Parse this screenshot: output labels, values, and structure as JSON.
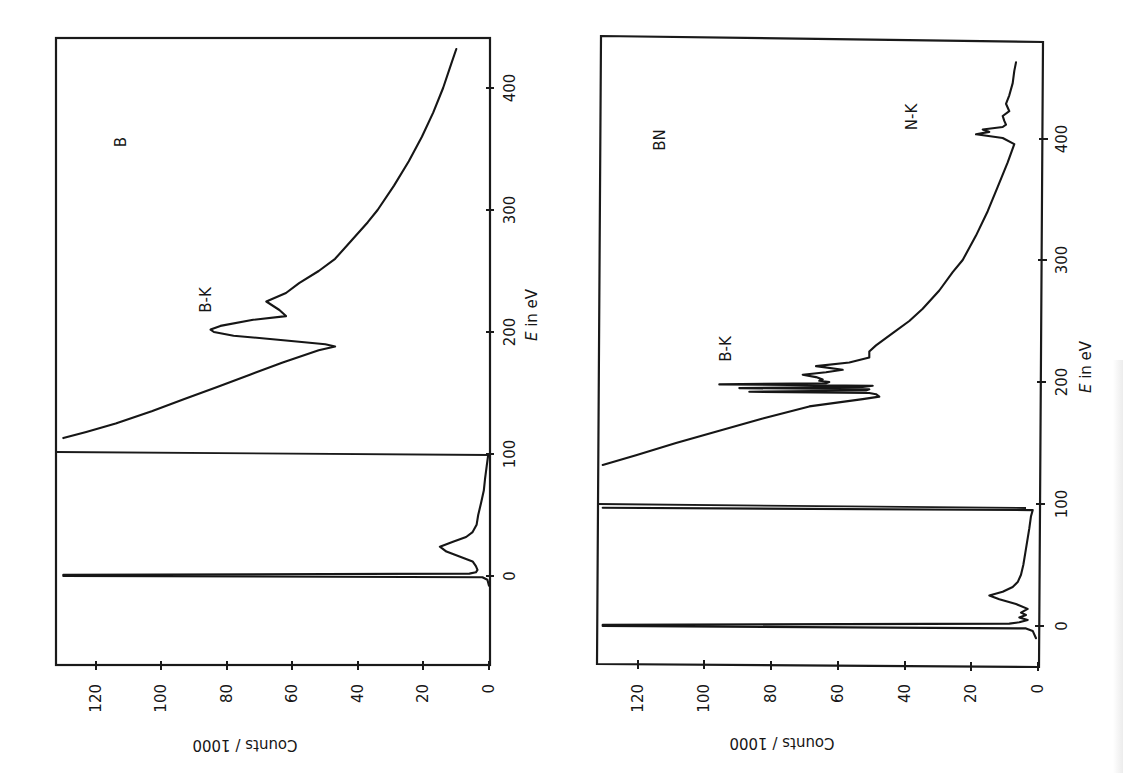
{
  "figure": {
    "panels_orientation": "rotated 90° (energy axis vertical on right, counts axis horizontal at bottom, increasing leftward)"
  },
  "chart_data": [
    {
      "type": "line",
      "title": "",
      "panel_label": "B",
      "xlabel": "E in eV",
      "ylabel": "Counts / 1000",
      "xlim": [
        -40,
        440
      ],
      "ylim": [
        0,
        130
      ],
      "grid": false,
      "x_ticks": [
        0,
        100,
        200,
        300,
        400
      ],
      "y_ticks": [
        0,
        20,
        40,
        60,
        80,
        100,
        120
      ],
      "x_tick_labels": [
        "0",
        "100",
        "200",
        "300",
        "400"
      ],
      "y_tick_labels": [
        "0",
        "20",
        "40",
        "60",
        "80",
        "100",
        "120"
      ],
      "annotations": [
        {
          "text": "B",
          "x": 355,
          "y": 110
        },
        {
          "text": "B-K",
          "x": 210,
          "y": 88
        }
      ],
      "scale_change_marker_eV": 100,
      "series": [
        {
          "name": "low-loss (zero-loss + plasmon)",
          "x": [
            -8,
            -3,
            -1,
            0,
            1,
            2,
            3,
            5,
            8,
            12,
            16,
            20,
            24,
            28,
            32,
            36,
            42,
            50,
            60,
            70,
            80,
            90,
            98,
            100
          ],
          "y": [
            0,
            0.5,
            2,
            130,
            130,
            6,
            4,
            3.5,
            4,
            5,
            9,
            13,
            15,
            11,
            7,
            5,
            3.8,
            3.3,
            2.4,
            1.6,
            1.2,
            0.7,
            0.3,
            0.2
          ]
        },
        {
          "name": "core-loss (scaled)",
          "x": [
            113,
            118,
            125,
            135,
            145,
            155,
            165,
            175,
            185,
            188,
            190,
            193,
            197,
            200,
            202,
            205,
            210,
            213,
            218,
            225,
            232,
            240,
            250,
            260,
            275,
            290,
            300,
            320,
            340,
            360,
            380,
            400,
            420,
            432
          ],
          "y": [
            130,
            123,
            114,
            103,
            93,
            83,
            73,
            63,
            52,
            47,
            50,
            62,
            78,
            84,
            85,
            82,
            72,
            62,
            64,
            68,
            62,
            58,
            52,
            47,
            42,
            37,
            34,
            29,
            24.5,
            20.5,
            17,
            14,
            11.5,
            10
          ]
        }
      ]
    },
    {
      "type": "line",
      "title": "",
      "panel_label": "BN",
      "xlabel": "E in eV",
      "ylabel": "Counts / 1000",
      "xlim": [
        -30,
        470
      ],
      "ylim": [
        0,
        130
      ],
      "grid": false,
      "x_ticks": [
        0,
        100,
        200,
        300,
        400
      ],
      "y_ticks": [
        0,
        20,
        40,
        60,
        80,
        100,
        120
      ],
      "x_tick_labels": [
        "0",
        "100",
        "200",
        "300",
        "400"
      ],
      "y_tick_labels": [
        "0",
        "20",
        "40",
        "60",
        "80",
        "100",
        "120"
      ],
      "annotations": [
        {
          "text": "BN",
          "x": 390,
          "y": 100
        },
        {
          "text": "B-K",
          "x": 230,
          "y": 89
        },
        {
          "text": "N-K",
          "x": 420,
          "y": 25
        }
      ],
      "scale_change_marker_eV": 97,
      "series": [
        {
          "name": "low-loss (zero-loss + plasmon)",
          "x": [
            -10,
            -4,
            -2,
            0,
            1,
            2,
            3,
            5,
            7,
            9,
            11,
            14,
            18,
            22,
            25,
            28,
            32,
            36,
            42,
            50,
            60,
            70,
            80,
            90,
            95,
            97
          ],
          "y": [
            0,
            1,
            3,
            130,
            130,
            8,
            5,
            2.5,
            5,
            3,
            4.5,
            2.5,
            6,
            11,
            14,
            10,
            7,
            5.5,
            4.5,
            3.8,
            3.2,
            2.6,
            2,
            1.5,
            1,
            130
          ]
        },
        {
          "name": "core-loss (scaled)",
          "x": [
            132,
            140,
            150,
            160,
            170,
            180,
            186,
            188,
            190,
            191,
            192,
            193,
            194,
            195,
            196,
            197,
            198,
            199,
            200,
            201,
            202,
            204,
            206,
            208,
            210,
            213,
            216,
            220,
            225,
            230,
            240,
            250,
            260,
            275,
            290,
            300,
            320,
            340,
            360,
            380,
            395,
            400,
            403,
            405,
            407,
            409,
            411,
            414,
            418,
            422,
            428,
            435,
            445,
            455,
            462
          ],
          "y": [
            130,
            120,
            108,
            95,
            82,
            68,
            52,
            47,
            48,
            50,
            86,
            51,
            50,
            89,
            52,
            49,
            95,
            63,
            62,
            65,
            64,
            66,
            70,
            63,
            58,
            66,
            56,
            50,
            50,
            48,
            43,
            38,
            34,
            29,
            25,
            22,
            18,
            14.5,
            11.5,
            8.5,
            6.5,
            10,
            18,
            14,
            16,
            10,
            9,
            9.5,
            10,
            8,
            9,
            8,
            7,
            6.5,
            6
          ]
        }
      ]
    }
  ],
  "panels": [
    {
      "id": "B",
      "label": "B",
      "edge_label": "B-K",
      "x_axis_title_italic": "E",
      "x_axis_title_rest": " in eV",
      "y_axis_title": "Counts / 1000",
      "e_ticks": [
        "0",
        "100",
        "200",
        "300",
        "400"
      ],
      "count_ticks": [
        "0",
        "20",
        "40",
        "60",
        "80",
        "100",
        "120"
      ]
    },
    {
      "id": "BN",
      "label": "BN",
      "edge_label": "B-K",
      "edge_label_2": "N-K",
      "x_axis_title_italic": "E",
      "x_axis_title_rest": " in eV",
      "y_axis_title": "Counts / 1000",
      "e_ticks": [
        "0",
        "100",
        "200",
        "300",
        "400"
      ],
      "count_ticks": [
        "0",
        "20",
        "40",
        "60",
        "80",
        "100",
        "120"
      ]
    }
  ]
}
